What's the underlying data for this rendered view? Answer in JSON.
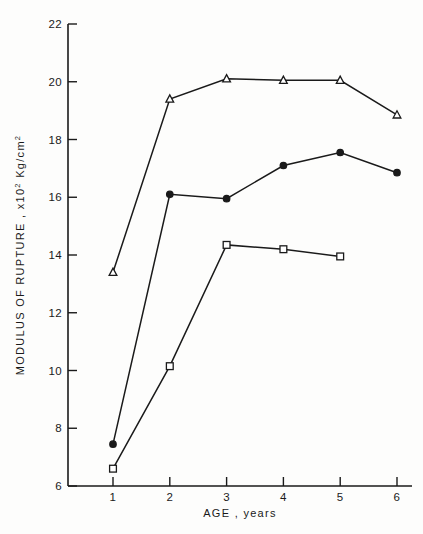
{
  "chart_data": {
    "type": "line",
    "title": "",
    "xlabel": "AGE , years",
    "ylabel": "MODULUS OF RUPTURE , x10",
    "ylabel_exp": "2",
    "ylabel_units": " Kg/cm",
    "ylabel_units_exp": "2",
    "x": [
      1,
      2,
      3,
      4,
      5,
      6
    ],
    "xticklabels": [
      "1",
      "2",
      "3",
      "4",
      "5",
      "6"
    ],
    "yticks": [
      6,
      8,
      10,
      12,
      14,
      16,
      18,
      20,
      22
    ],
    "yticklabels": [
      "6",
      "8",
      "10",
      "12",
      "14",
      "16",
      "18",
      "20",
      "22"
    ],
    "xlim": [
      0.3,
      6.5
    ],
    "ylim": [
      6,
      22
    ],
    "grid": false,
    "legend": "none",
    "series": [
      {
        "name": "open-triangle",
        "marker": "triangle-open",
        "x": [
          1,
          2,
          3,
          4,
          5,
          6
        ],
        "values": [
          13.4,
          19.4,
          20.1,
          20.05,
          20.05,
          18.85
        ]
      },
      {
        "name": "filled-circle",
        "marker": "circle-filled",
        "x": [
          1,
          2,
          3,
          4,
          5,
          6
        ],
        "values": [
          7.45,
          16.1,
          15.95,
          17.1,
          17.55,
          16.85
        ]
      },
      {
        "name": "open-square",
        "marker": "square-open",
        "x": [
          1,
          2,
          3,
          4,
          5
        ],
        "values": [
          6.6,
          10.15,
          14.35,
          14.2,
          13.95
        ]
      }
    ],
    "colors": {
      "ink": "#1a1a1a",
      "background": "#fdfdfc"
    }
  }
}
